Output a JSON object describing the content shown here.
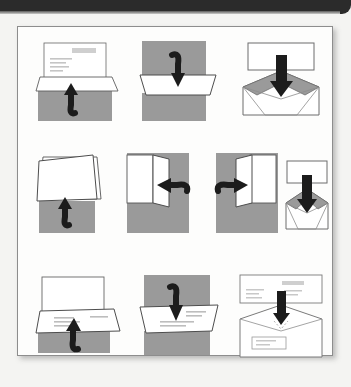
{
  "page": {
    "kind": "scanned-instruction-diagram",
    "top_bar_color": "#2b2b2b",
    "paper_color": "#fdfdfc",
    "frame_border_color": "#8d8d8d",
    "envelope_gray": "#9a9a9a",
    "arrow_color": "#1c1c1c",
    "line_art_color": "#555555",
    "text_line_color": "#b9b9b9",
    "rows": [
      {
        "row_label": "row-1",
        "panel_count": 3
      },
      {
        "row_label": "row-2",
        "panel_count": 4
      },
      {
        "row_label": "row-3",
        "panel_count": 3
      }
    ],
    "panels": [
      {
        "step": "1",
        "name": "panel-fold-bottom-up",
        "arrow": "curved-up",
        "arrow_name": "curved-up-arrow"
      },
      {
        "step": "2",
        "name": "panel-fold-top-down",
        "arrow": "curved-down",
        "arrow_name": "curved-down-arrow"
      },
      {
        "step": "3",
        "name": "panel-insert-into-envelope",
        "arrow": "straight-down",
        "arrow_name": "straight-down-arrow"
      },
      {
        "step": "4",
        "name": "panel-fold-half-up",
        "arrow": "curved-up",
        "arrow_name": "curved-up-arrow"
      },
      {
        "step": "5",
        "name": "panel-fold-left",
        "arrow": "curved-left",
        "arrow_name": "curved-left-arrow"
      },
      {
        "step": "6",
        "name": "panel-fold-right",
        "arrow": "curved-right",
        "arrow_name": "curved-right-arrow"
      },
      {
        "step": "7",
        "name": "panel-insert-folded",
        "arrow": "straight-down",
        "arrow_name": "straight-down-arrow"
      },
      {
        "step": "8",
        "name": "panel-letter-fold-up",
        "arrow": "curved-up",
        "arrow_name": "curved-up-arrow"
      },
      {
        "step": "9",
        "name": "panel-letter-fold-down",
        "arrow": "curved-down",
        "arrow_name": "curved-down-arrow"
      },
      {
        "step": "10",
        "name": "panel-sealed-envelope",
        "arrow": "straight-down",
        "arrow_name": "straight-down-arrow"
      }
    ]
  }
}
